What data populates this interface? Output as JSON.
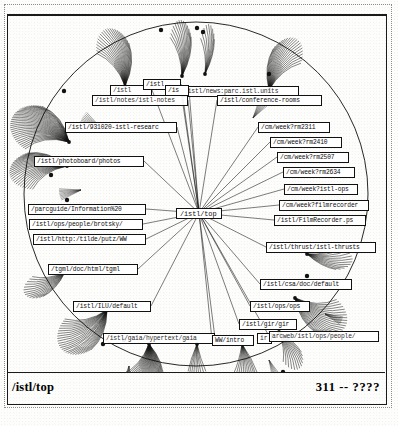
{
  "window": {
    "title": "Hyperbolic Browser",
    "center_node": "/istl/top"
  },
  "status_bar": {
    "left_label": "/istl/top",
    "right_label": "311 -- ????"
  },
  "graph": {
    "type": "hyperbolic-tree",
    "root": "/istl/top",
    "nodes": [
      {
        "id": "n01",
        "label": "/istl",
        "x": 103,
        "y": 71,
        "w": 42,
        "state": "occluded"
      },
      {
        "id": "n02",
        "label": "/istl",
        "x": 136,
        "y": 65,
        "w": 38,
        "state": "normal"
      },
      {
        "id": "n03",
        "label": "/is",
        "x": 158,
        "y": 71,
        "w": 24,
        "state": "normal"
      },
      {
        "id": "n04",
        "label": "/istl/news:parc.istl.units",
        "x": 174,
        "y": 72,
        "w": 118,
        "state": "occluded"
      },
      {
        "id": "n05",
        "label": "/istl/notes/istl-notes",
        "x": 85,
        "y": 81,
        "w": 96,
        "state": "occluded"
      },
      {
        "id": "n06",
        "label": "/istl/conference-rooms",
        "x": 210,
        "y": 81,
        "w": 105,
        "state": "normal"
      },
      {
        "id": "n07",
        "label": "/istl/931020-istl-researc",
        "x": 58,
        "y": 108,
        "w": 112,
        "state": "normal"
      },
      {
        "id": "n08",
        "label": "/istl/photoboard/photos",
        "x": 27,
        "y": 142,
        "w": 110,
        "state": "normal"
      },
      {
        "id": "n09",
        "label": "/cm/week?rm2311",
        "x": 251,
        "y": 108,
        "w": 72,
        "state": "normal"
      },
      {
        "id": "n10",
        "label": "/cm/week?rm2410",
        "x": 263,
        "y": 123,
        "w": 72,
        "state": "normal"
      },
      {
        "id": "n11",
        "label": "/cm/week?rm2507",
        "x": 270,
        "y": 138,
        "w": 72,
        "state": "normal"
      },
      {
        "id": "n12",
        "label": "/cm/week?rm2634",
        "x": 276,
        "y": 153,
        "w": 72,
        "state": "normal"
      },
      {
        "id": "n13",
        "label": "/cm/week?istl-ops",
        "x": 277,
        "y": 170,
        "w": 74,
        "state": "normal"
      },
      {
        "id": "n14",
        "label": "/cm/week?filmrecorder",
        "x": 272,
        "y": 186,
        "w": 90,
        "state": "normal"
      },
      {
        "id": "n15",
        "label": "/istl/FilmRecorder.ps",
        "x": 267,
        "y": 201,
        "w": 92,
        "state": "normal"
      },
      {
        "id": "n16",
        "label": "/istl/thrust/istl-thrusts",
        "x": 259,
        "y": 228,
        "w": 110,
        "state": "normal"
      },
      {
        "id": "n17",
        "label": "/parcguide/Information%20",
        "x": 21,
        "y": 190,
        "w": 118,
        "state": "normal"
      },
      {
        "id": "n18",
        "label": "/istl/ops/people/brotsky/",
        "x": 22,
        "y": 205,
        "w": 114,
        "state": "normal"
      },
      {
        "id": "n19",
        "label": "/istl/http:/tilde/putz/WW",
        "x": 26,
        "y": 220,
        "w": 113,
        "state": "normal"
      },
      {
        "id": "n20",
        "label": "/tgml/doc/html/tgml",
        "x": 41,
        "y": 250,
        "w": 90,
        "state": "normal"
      },
      {
        "id": "n21",
        "label": "/istl/ILU/default",
        "x": 66,
        "y": 287,
        "w": 78,
        "state": "normal"
      },
      {
        "id": "n22",
        "label": "/istl/gaia/hypertext/gaia",
        "x": 96,
        "y": 319,
        "w": 112,
        "state": "occluded"
      },
      {
        "id": "n23",
        "label": "WW/intro",
        "x": 205,
        "y": 321,
        "w": 42,
        "state": "normal"
      },
      {
        "id": "n24",
        "label": "ir",
        "x": 250,
        "y": 319,
        "w": 15,
        "state": "occluded"
      },
      {
        "id": "n25",
        "label": "arcweb/istl/ops/people/",
        "x": 262,
        "y": 317,
        "w": 110,
        "state": "occluded"
      },
      {
        "id": "n26",
        "label": "/istl/gir/gir",
        "x": 232,
        "y": 305,
        "w": 58,
        "state": "normal"
      },
      {
        "id": "n27",
        "label": "/istl/ops/ops",
        "x": 243,
        "y": 287,
        "w": 60,
        "state": "normal"
      },
      {
        "id": "n28",
        "label": "/istl/csa/doc/default",
        "x": 253,
        "y": 265,
        "w": 92,
        "state": "normal"
      }
    ],
    "center": {
      "label": "/istl/top",
      "x": 169,
      "y": 194,
      "w": 46
    },
    "spokes": [
      {
        "to": "n01"
      },
      {
        "to": "n02"
      },
      {
        "to": "n03"
      },
      {
        "to": "n04"
      },
      {
        "to": "n05"
      },
      {
        "to": "n06"
      },
      {
        "to": "n07"
      },
      {
        "to": "n08"
      },
      {
        "to": "n09"
      },
      {
        "to": "n10"
      },
      {
        "to": "n11"
      },
      {
        "to": "n12"
      },
      {
        "to": "n13"
      },
      {
        "to": "n14"
      },
      {
        "to": "n15"
      },
      {
        "to": "n16"
      },
      {
        "to": "n17"
      },
      {
        "to": "n18"
      },
      {
        "to": "n19"
      },
      {
        "to": "n20"
      },
      {
        "to": "n21"
      },
      {
        "to": "n22"
      },
      {
        "to": "n23"
      },
      {
        "to": "n25"
      },
      {
        "to": "n26"
      },
      {
        "to": "n27"
      },
      {
        "to": "n28"
      }
    ]
  },
  "colors": {
    "ink": "#111111",
    "paper": "#fdfdfb",
    "frame": "#1a1a1a",
    "faded_ink": "#555555"
  }
}
